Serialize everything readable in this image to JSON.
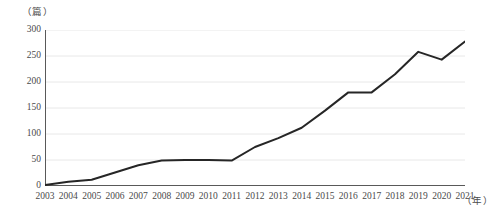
{
  "chart_data": {
    "type": "line",
    "title": "",
    "subtitle": "",
    "xlabel": "（年）",
    "ylabel": "（篇）",
    "grid": true,
    "legend": false,
    "legend_position": "none",
    "xlim": [
      2003,
      2021
    ],
    "ylim": [
      0,
      300
    ],
    "y_ticks": [
      0,
      50,
      100,
      150,
      200,
      250,
      300
    ],
    "categories": [
      "2003",
      "2004",
      "2005",
      "2006",
      "2007",
      "2008",
      "2009",
      "2010",
      "2011",
      "2012",
      "2013",
      "2014",
      "2015",
      "2016",
      "2017",
      "2018",
      "2019",
      "2020",
      "2021"
    ],
    "values": [
      2,
      8,
      12,
      26,
      40,
      49,
      50,
      50,
      49,
      75,
      92,
      112,
      145,
      180,
      180,
      215,
      258,
      243,
      278
    ],
    "series": [
      {
        "name": "发文量",
        "color": "#262626",
        "values": [
          2,
          8,
          12,
          26,
          40,
          49,
          50,
          50,
          49,
          75,
          92,
          112,
          145,
          180,
          180,
          215,
          258,
          243,
          278
        ]
      }
    ],
    "line_color": "#262626",
    "grid_color": "#e8e8e8",
    "axis_color": "#595959"
  }
}
